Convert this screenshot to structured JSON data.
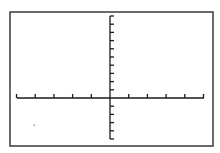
{
  "screen": {
    "description": "Graphing calculator window with coordinate axes",
    "background": "#ffffff",
    "frame_color": "#3a3a3a",
    "axis_color": "#1a1a1a"
  },
  "window": {
    "xmin": -10,
    "xmax": 10,
    "xscl": 2,
    "ymin": -6,
    "ymax": 10,
    "yscl": 1
  },
  "geometry": {
    "frame": {
      "x": 10,
      "y": 12,
      "w": 203,
      "h": 134
    },
    "origin": {
      "x": 110,
      "y": 98
    },
    "x_axis": {
      "x1": 17,
      "x2": 204
    },
    "y_axis": {
      "y1": 16,
      "y2": 139
    },
    "x_tick_spacing": 18.7,
    "x_ticks_left": 5,
    "x_ticks_right": 5,
    "y_tick_spacing": 8.2,
    "y_ticks_up": 10,
    "y_ticks_down": 5,
    "tick_length": 4
  },
  "points": [
    {
      "name": "stray-dot",
      "x": 34,
      "y": 125,
      "color": "#9a9a9a"
    }
  ]
}
